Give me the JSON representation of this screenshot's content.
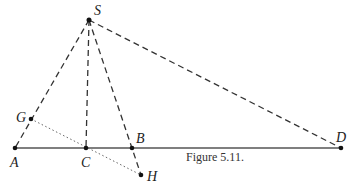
{
  "figure": {
    "caption": "Figure 5.11.",
    "points": {
      "S": {
        "label": "S",
        "x": 89,
        "y": 20
      },
      "A": {
        "label": "A",
        "x": 15,
        "y": 148
      },
      "C": {
        "label": "C",
        "x": 86,
        "y": 148
      },
      "B": {
        "label": "B",
        "x": 132,
        "y": 148
      },
      "D": {
        "label": "D",
        "x": 341,
        "y": 148
      },
      "G": {
        "label": "G",
        "x": 31,
        "y": 119
      },
      "H": {
        "label": "H",
        "x": 141,
        "y": 175
      }
    },
    "segments": [
      {
        "from": "A",
        "to": "D",
        "style": "solid"
      },
      {
        "from": "S",
        "to": "A",
        "style": "dashed"
      },
      {
        "from": "S",
        "to": "C",
        "style": "dashed"
      },
      {
        "from": "S",
        "to": "H",
        "style": "dashed"
      },
      {
        "from": "S",
        "to": "D",
        "style": "dashed"
      },
      {
        "from": "G",
        "to": "H",
        "style": "dotted"
      }
    ]
  }
}
